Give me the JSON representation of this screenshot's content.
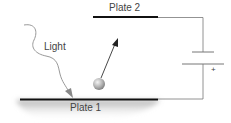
{
  "diagram": {
    "labels": {
      "plate2": "Plate 2",
      "plate1": "Plate 1",
      "light": "Light",
      "battery_positive": "+"
    },
    "elements": [
      {
        "id": "plate-2",
        "type": "metal plate",
        "position": "top"
      },
      {
        "id": "plate-1",
        "type": "metal plate",
        "position": "bottom"
      },
      {
        "id": "light-ray",
        "type": "wavy arrow",
        "target": "plate-1"
      },
      {
        "id": "electron",
        "type": "sphere",
        "motion": "toward plate-2"
      },
      {
        "id": "battery",
        "type": "cell",
        "polarity_marker": "+"
      },
      {
        "id": "circuit-wire",
        "type": "wire",
        "connects": [
          "plate-2",
          "battery",
          "plate-1"
        ]
      }
    ],
    "colors": {
      "plate": "#111111",
      "wire": "#777777",
      "text": "#444444",
      "light": "#999999",
      "electron": "#aaaaaa",
      "arrow": "#333333"
    }
  }
}
